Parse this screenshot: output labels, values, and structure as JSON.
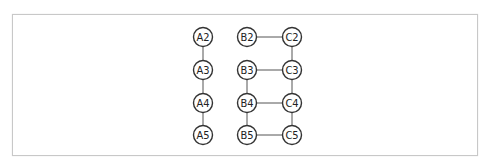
{
  "diagram": {
    "type": "graph",
    "nodes": [
      {
        "id": "A2",
        "label": "A2",
        "x": 203,
        "y": 37
      },
      {
        "id": "A3",
        "label": "A3",
        "x": 203,
        "y": 70
      },
      {
        "id": "A4",
        "label": "A4",
        "x": 203,
        "y": 103
      },
      {
        "id": "A5",
        "label": "A5",
        "x": 203,
        "y": 135
      },
      {
        "id": "B2",
        "label": "B2",
        "x": 247,
        "y": 37
      },
      {
        "id": "B3",
        "label": "B3",
        "x": 247,
        "y": 70
      },
      {
        "id": "B4",
        "label": "B4",
        "x": 247,
        "y": 103
      },
      {
        "id": "B5",
        "label": "B5",
        "x": 247,
        "y": 135
      },
      {
        "id": "C2",
        "label": "C2",
        "x": 292,
        "y": 37
      },
      {
        "id": "C3",
        "label": "C3",
        "x": 292,
        "y": 70
      },
      {
        "id": "C4",
        "label": "C4",
        "x": 292,
        "y": 103
      },
      {
        "id": "C5",
        "label": "C5",
        "x": 292,
        "y": 135
      }
    ],
    "edges": [
      [
        "A2",
        "A3"
      ],
      [
        "A3",
        "A4"
      ],
      [
        "A4",
        "A5"
      ],
      [
        "B2",
        "C2"
      ],
      [
        "C2",
        "C3"
      ],
      [
        "B3",
        "C3"
      ],
      [
        "B3",
        "B4"
      ],
      [
        "C3",
        "C4"
      ],
      [
        "B4",
        "C4"
      ],
      [
        "B4",
        "B5"
      ],
      [
        "C4",
        "C5"
      ],
      [
        "B5",
        "C5"
      ]
    ],
    "node_radius": 9.5
  }
}
